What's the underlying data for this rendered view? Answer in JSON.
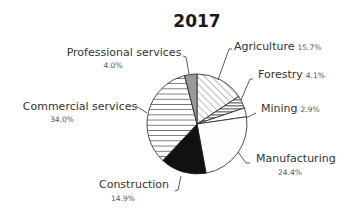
{
  "chart_data": {
    "type": "pie",
    "title": "2017",
    "start_angle": "12 o'clock",
    "direction": "clockwise",
    "unit": "%",
    "slices": [
      {
        "label": "Agriculture",
        "value": 15.7,
        "value_text": "15.7%",
        "fill": "diagonal-hatch"
      },
      {
        "label": "Forestry",
        "value": 4.1,
        "value_text": "4.1%",
        "fill": "gray-horizontal-stripes"
      },
      {
        "label": "Mining",
        "value": 2.9,
        "value_text": "2.9%",
        "fill": "white"
      },
      {
        "label": "Manufacturing",
        "value": 24.4,
        "value_text": "24.4%",
        "fill": "light-speckle"
      },
      {
        "label": "Construction",
        "value": 14.9,
        "value_text": "14.9%",
        "fill": "black"
      },
      {
        "label": "Commercial services",
        "value": 34.0,
        "value_text": "34.0%",
        "fill": "horizontal-lines"
      },
      {
        "label": "Professional services",
        "value": 4.0,
        "value_text": "4.0%",
        "fill": "gray"
      }
    ],
    "categories": [
      "Agriculture",
      "Forestry",
      "Mining",
      "Manufacturing",
      "Construction",
      "Commercial services",
      "Professional services"
    ],
    "values": [
      15.7,
      4.1,
      2.9,
      24.4,
      14.9,
      34.0,
      4.0
    ],
    "legend": "none (direct labels with leader lines)"
  },
  "colors": {
    "outline": "#222222",
    "black_fill": "#111111",
    "gray_fill": "#999999",
    "text": "#333333"
  }
}
